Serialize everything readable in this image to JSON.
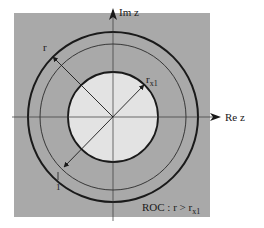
{
  "diagram": {
    "axes": {
      "imag_label": "Im z",
      "real_label": "Re z"
    },
    "labels": {
      "r": "r",
      "r_x1_main": "r",
      "r_x1_sub": "x1",
      "one": "1",
      "roc_prefix": "ROC : r > r",
      "roc_sub": "x1"
    },
    "geometry": {
      "center": [
        113,
        117
      ],
      "outer_radius": 85,
      "unit_radius": 73,
      "inner_radius": 45,
      "box": [
        14,
        13,
        196,
        204
      ]
    },
    "colors": {
      "roc_fill": "#a9a9a9",
      "inner_fill": "#e3e3e3",
      "stroke": "#1a1a1a",
      "background": "#ffffff"
    }
  }
}
